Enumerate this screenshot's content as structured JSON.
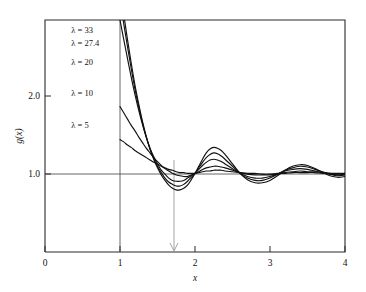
{
  "chart_data": {
    "type": "line",
    "title": "",
    "subtitle": "",
    "xlabel": "x",
    "ylabel": "g(x)",
    "xlim": [
      0,
      4
    ],
    "ylim": [
      0,
      2.95
    ],
    "xticks": [
      "0",
      "1",
      "2",
      "3",
      "4"
    ],
    "xtick_values": [
      0,
      1,
      2,
      3,
      4
    ],
    "yticks": [
      "1.0",
      "2.0"
    ],
    "ytick_values": [
      1.0,
      2.0
    ],
    "grid": false,
    "legend_position": "inside-upper-left",
    "reference_lines": [
      {
        "name": "unit-horizontal",
        "orientation": "horizontal",
        "value": 1.0
      },
      {
        "name": "core-vertical",
        "orientation": "vertical",
        "value": 1.0
      }
    ],
    "annotations": [
      {
        "name": "tick-arrow",
        "x": 1.72,
        "y": 0.0,
        "text": ""
      }
    ],
    "series": [
      {
        "name": "lambda-33",
        "label": "λ = 33",
        "label_x": 1.07,
        "label_y": 2.78,
        "x": [
          1.0,
          1.05,
          1.1,
          1.15,
          1.2,
          1.25,
          1.3,
          1.35,
          1.4,
          1.45,
          1.5,
          1.55,
          1.6,
          1.65,
          1.7,
          1.75,
          1.8,
          1.85,
          1.9,
          1.95,
          2.0,
          2.05,
          2.1,
          2.15,
          2.2,
          2.25,
          2.3,
          2.35,
          2.4,
          2.5,
          2.6,
          2.7,
          2.8,
          2.9,
          3.0,
          3.1,
          3.2,
          3.3,
          3.4,
          3.5,
          3.6,
          3.7,
          3.8,
          3.9,
          4.0
        ],
        "y": [
          3.35,
          3.02,
          2.7,
          2.4,
          2.12,
          1.88,
          1.66,
          1.47,
          1.31,
          1.18,
          1.07,
          0.98,
          0.91,
          0.85,
          0.81,
          0.79,
          0.79,
          0.81,
          0.85,
          0.92,
          1.0,
          1.09,
          1.18,
          1.26,
          1.31,
          1.33,
          1.32,
          1.29,
          1.24,
          1.12,
          1.0,
          0.92,
          0.88,
          0.88,
          0.91,
          0.97,
          1.04,
          1.09,
          1.11,
          1.1,
          1.06,
          1.01,
          0.97,
          0.95,
          0.96
        ]
      },
      {
        "name": "lambda-27-4",
        "label": "λ = 27.4",
        "label_x": 1.07,
        "label_y": 2.62,
        "x": [
          1.0,
          1.05,
          1.1,
          1.15,
          1.2,
          1.25,
          1.3,
          1.35,
          1.4,
          1.45,
          1.5,
          1.55,
          1.6,
          1.65,
          1.7,
          1.75,
          1.8,
          1.85,
          1.9,
          1.95,
          2.0,
          2.05,
          2.1,
          2.15,
          2.2,
          2.25,
          2.3,
          2.35,
          2.4,
          2.5,
          2.6,
          2.7,
          2.8,
          2.9,
          3.0,
          3.1,
          3.2,
          3.3,
          3.4,
          3.5,
          3.6,
          3.7,
          3.8,
          3.9,
          4.0
        ],
        "y": [
          3.2,
          2.9,
          2.61,
          2.33,
          2.07,
          1.84,
          1.64,
          1.46,
          1.31,
          1.19,
          1.09,
          1.01,
          0.94,
          0.89,
          0.86,
          0.84,
          0.84,
          0.86,
          0.9,
          0.95,
          1.0,
          1.07,
          1.14,
          1.2,
          1.24,
          1.26,
          1.25,
          1.22,
          1.18,
          1.09,
          1.0,
          0.94,
          0.91,
          0.91,
          0.94,
          0.99,
          1.04,
          1.07,
          1.09,
          1.08,
          1.05,
          1.02,
          0.99,
          0.97,
          0.98
        ]
      },
      {
        "name": "lambda-20",
        "label": "λ = 20",
        "label_x": 1.07,
        "label_y": 2.38,
        "x": [
          1.0,
          1.05,
          1.1,
          1.15,
          1.2,
          1.25,
          1.3,
          1.35,
          1.4,
          1.45,
          1.5,
          1.55,
          1.6,
          1.65,
          1.7,
          1.75,
          1.8,
          1.85,
          1.9,
          1.95,
          2.0,
          2.05,
          2.1,
          2.15,
          2.2,
          2.25,
          2.3,
          2.35,
          2.4,
          2.5,
          2.6,
          2.7,
          2.8,
          2.9,
          3.0,
          3.1,
          3.2,
          3.3,
          3.4,
          3.5,
          3.6,
          3.7,
          3.8,
          3.9,
          4.0
        ],
        "y": [
          2.95,
          2.7,
          2.46,
          2.22,
          2.0,
          1.8,
          1.62,
          1.46,
          1.32,
          1.21,
          1.12,
          1.04,
          0.99,
          0.94,
          0.91,
          0.9,
          0.9,
          0.91,
          0.94,
          0.97,
          1.0,
          1.05,
          1.1,
          1.14,
          1.17,
          1.18,
          1.17,
          1.15,
          1.12,
          1.06,
          1.0,
          0.96,
          0.94,
          0.94,
          0.96,
          0.99,
          1.03,
          1.05,
          1.06,
          1.05,
          1.03,
          1.01,
          0.99,
          0.98,
          0.99
        ]
      },
      {
        "name": "lambda-10",
        "label": "λ = 10",
        "label_x": 1.07,
        "label_y": 1.98,
        "x": [
          1.0,
          1.05,
          1.1,
          1.15,
          1.2,
          1.25,
          1.3,
          1.35,
          1.4,
          1.45,
          1.5,
          1.55,
          1.6,
          1.65,
          1.7,
          1.75,
          1.8,
          1.85,
          1.9,
          1.95,
          2.0,
          2.05,
          2.1,
          2.15,
          2.2,
          2.25,
          2.3,
          2.35,
          2.4,
          2.5,
          2.6,
          2.7,
          2.8,
          2.9,
          3.0,
          3.1,
          3.2,
          3.3,
          3.4,
          3.5,
          3.6,
          3.7,
          3.8,
          3.9,
          4.0
        ],
        "y": [
          1.85,
          1.77,
          1.69,
          1.61,
          1.54,
          1.46,
          1.39,
          1.32,
          1.26,
          1.2,
          1.15,
          1.1,
          1.06,
          1.03,
          1.0,
          0.98,
          0.97,
          0.96,
          0.96,
          0.98,
          1.0,
          1.02,
          1.05,
          1.07,
          1.08,
          1.09,
          1.09,
          1.08,
          1.07,
          1.04,
          1.01,
          0.99,
          0.98,
          0.98,
          0.98,
          0.99,
          1.01,
          1.02,
          1.03,
          1.02,
          1.02,
          1.01,
          1.0,
          0.99,
          1.0
        ]
      },
      {
        "name": "lambda-5",
        "label": "λ = 5",
        "label_x": 1.07,
        "label_y": 1.58,
        "x": [
          1.0,
          1.05,
          1.1,
          1.15,
          1.2,
          1.25,
          1.3,
          1.35,
          1.4,
          1.45,
          1.5,
          1.55,
          1.6,
          1.65,
          1.7,
          1.75,
          1.8,
          1.85,
          1.9,
          1.95,
          2.0,
          2.05,
          2.1,
          2.15,
          2.2,
          2.25,
          2.3,
          2.35,
          2.4,
          2.5,
          2.6,
          2.7,
          2.8,
          2.9,
          3.0,
          3.1,
          3.2,
          3.3,
          3.4,
          3.5,
          3.6,
          3.7,
          3.8,
          3.9,
          4.0
        ],
        "y": [
          1.43,
          1.4,
          1.36,
          1.33,
          1.29,
          1.26,
          1.23,
          1.2,
          1.17,
          1.14,
          1.12,
          1.09,
          1.07,
          1.05,
          1.04,
          1.02,
          1.01,
          1.01,
          1.0,
          1.0,
          1.0,
          1.01,
          1.02,
          1.03,
          1.03,
          1.04,
          1.04,
          1.04,
          1.03,
          1.02,
          1.01,
          1.0,
          1.0,
          0.99,
          0.99,
          1.0,
          1.0,
          1.01,
          1.01,
          1.01,
          1.01,
          1.0,
          1.0,
          1.0,
          1.0
        ]
      }
    ]
  },
  "style": {
    "curve_color": "#111111",
    "frame_color": "#2b2b2b",
    "reference_color": "#555555",
    "background": "#ffffff"
  }
}
